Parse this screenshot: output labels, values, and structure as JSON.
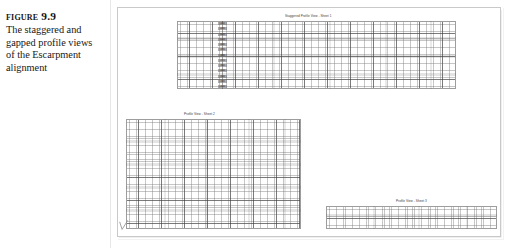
{
  "caption": {
    "figure_number": "Figure 9.9",
    "text": "The staggered and gapped profile views of the Escarpment alignment"
  },
  "figure": {
    "frame_color": "#c9c9c9",
    "background": "#ffffff",
    "grid_line_color": "#5a5a5a",
    "profiles": [
      {
        "id": "profile-top",
        "title": "Staggered Profile View - Sheet 1",
        "axis_labels": [
          "440",
          "430",
          "420",
          "410",
          "400",
          "390",
          "380",
          "370",
          "360",
          "350",
          "340",
          "330",
          "320"
        ]
      },
      {
        "id": "profile-middle",
        "title": "Profile View - Sheet 2"
      },
      {
        "id": "profile-bottom",
        "title": "Profile View - Sheet 3"
      }
    ]
  }
}
